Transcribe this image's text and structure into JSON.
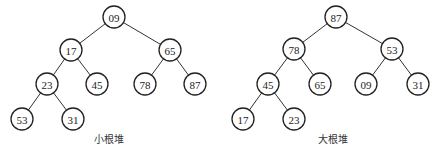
{
  "colors": {
    "stroke": "#222222",
    "background": "#ffffff",
    "text": "#222222"
  },
  "node_radius": 11,
  "trees": [
    {
      "caption": "小根堆",
      "caption_pos": [
        109,
        143
      ],
      "nodes": [
        {
          "id": "a0",
          "label": "09",
          "x": 114,
          "y": 17
        },
        {
          "id": "a1",
          "label": "17",
          "x": 71,
          "y": 50
        },
        {
          "id": "a2",
          "label": "65",
          "x": 170,
          "y": 50
        },
        {
          "id": "a3",
          "label": "23",
          "x": 47,
          "y": 84
        },
        {
          "id": "a4",
          "label": "45",
          "x": 97,
          "y": 84
        },
        {
          "id": "a5",
          "label": "78",
          "x": 145,
          "y": 84
        },
        {
          "id": "a6",
          "label": "87",
          "x": 195,
          "y": 84
        },
        {
          "id": "a7",
          "label": "53",
          "x": 22,
          "y": 119
        },
        {
          "id": "a8",
          "label": "31",
          "x": 73,
          "y": 119
        }
      ],
      "edges": [
        [
          "a0",
          "a1"
        ],
        [
          "a0",
          "a2"
        ],
        [
          "a1",
          "a3"
        ],
        [
          "a1",
          "a4"
        ],
        [
          "a2",
          "a5"
        ],
        [
          "a2",
          "a6"
        ],
        [
          "a3",
          "a7"
        ],
        [
          "a3",
          "a8"
        ]
      ]
    },
    {
      "caption": "大根堆",
      "caption_pos": [
        333,
        143
      ],
      "nodes": [
        {
          "id": "b0",
          "label": "87",
          "x": 336,
          "y": 17
        },
        {
          "id": "b1",
          "label": "78",
          "x": 294,
          "y": 49
        },
        {
          "id": "b2",
          "label": "53",
          "x": 392,
          "y": 49
        },
        {
          "id": "b3",
          "label": "45",
          "x": 268,
          "y": 84
        },
        {
          "id": "b4",
          "label": "65",
          "x": 320,
          "y": 84
        },
        {
          "id": "b5",
          "label": "09",
          "x": 366,
          "y": 84
        },
        {
          "id": "b6",
          "label": "31",
          "x": 418,
          "y": 84
        },
        {
          "id": "b7",
          "label": "17",
          "x": 243,
          "y": 119
        },
        {
          "id": "b8",
          "label": "23",
          "x": 294,
          "y": 119
        }
      ],
      "edges": [
        [
          "b0",
          "b1"
        ],
        [
          "b0",
          "b2"
        ],
        [
          "b1",
          "b3"
        ],
        [
          "b1",
          "b4"
        ],
        [
          "b2",
          "b5"
        ],
        [
          "b2",
          "b6"
        ],
        [
          "b3",
          "b7"
        ],
        [
          "b3",
          "b8"
        ]
      ]
    }
  ]
}
